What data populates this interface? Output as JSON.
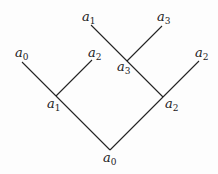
{
  "diagram": {
    "type": "tree",
    "line_color": "#222222",
    "nodes": [
      {
        "id": "root",
        "label": "a",
        "sub": "0"
      },
      {
        "id": "left-junction",
        "label": "a",
        "sub": "1"
      },
      {
        "id": "right-junction",
        "label": "a",
        "sub": "2"
      },
      {
        "id": "cross-junction",
        "label": "a",
        "sub": "3"
      },
      {
        "id": "leaf-left-a0",
        "label": "a",
        "sub": "0"
      },
      {
        "id": "leaf-left-a2",
        "label": "a",
        "sub": "2"
      },
      {
        "id": "leaf-top-a1",
        "label": "a",
        "sub": "1"
      },
      {
        "id": "leaf-top-a3",
        "label": "a",
        "sub": "3"
      },
      {
        "id": "leaf-right-a2",
        "label": "a",
        "sub": "2"
      }
    ]
  }
}
